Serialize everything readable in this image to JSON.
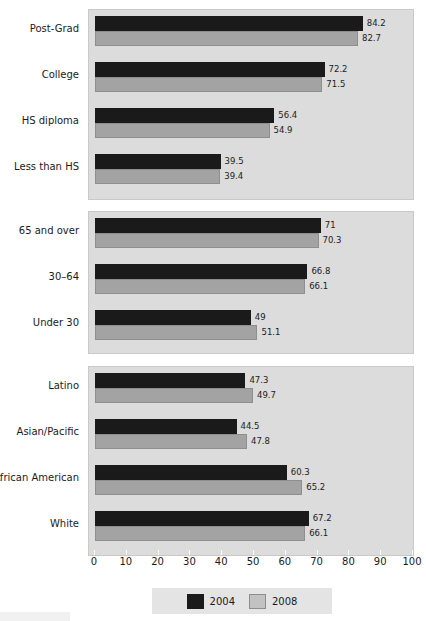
{
  "chart_data": {
    "type": "bar",
    "orientation": "horizontal",
    "title": "",
    "xlabel": "",
    "ylabel": "",
    "xlim": [
      0,
      100
    ],
    "xticks": [
      0,
      10,
      20,
      30,
      40,
      50,
      60,
      70,
      80,
      90,
      100
    ],
    "grid": false,
    "legend_position": "bottom-center",
    "legend": [
      "2004",
      "2008"
    ],
    "series": [
      {
        "name": "2004",
        "color": "#1a1a1a"
      },
      {
        "name": "2008",
        "color": "#a3a3a3"
      }
    ],
    "panels": [
      {
        "name": "education",
        "categories": [
          "Post-Grad",
          "College",
          "HS diploma",
          "Less than HS"
        ],
        "values_2004": [
          84.2,
          72.2,
          56.4,
          39.5
        ],
        "values_2008": [
          82.7,
          71.5,
          54.9,
          39.4
        ]
      },
      {
        "name": "age",
        "categories": [
          "65 and over",
          "30–64",
          "Under 30"
        ],
        "values_2004": [
          71,
          66.8,
          49
        ],
        "values_2008": [
          70.3,
          66.1,
          51.1
        ]
      },
      {
        "name": "race-ethnicity",
        "categories": [
          "Latino",
          "Asian/Pacific",
          "African American",
          "White"
        ],
        "values_2004": [
          47.3,
          44.5,
          60.3,
          67.2
        ],
        "values_2008": [
          49.7,
          47.8,
          65.2,
          66.1
        ]
      }
    ],
    "value_labels": {
      "education": {
        "2004": [
          "84.2",
          "72.2",
          "56.4",
          "39.5"
        ],
        "2008": [
          "82.7",
          "71.5",
          "54.9",
          "39.4"
        ]
      },
      "age": {
        "2004": [
          "71",
          "66.8",
          "49"
        ],
        "2008": [
          "70.3",
          "66.1",
          "51.1"
        ]
      },
      "race-ethnicity": {
        "2004": [
          "47.3",
          "44.5",
          "60.3",
          "67.2"
        ],
        "2008": [
          "49.7",
          "47.8",
          "65.2",
          "66.1"
        ]
      }
    },
    "tick_labels": [
      "0",
      "10",
      "20",
      "30",
      "40",
      "50",
      "60",
      "70",
      "80",
      "90",
      "100"
    ]
  },
  "colors": {
    "series_2004": "#1a1a1a",
    "series_2008": "#a3a3a3",
    "panel_background": "#dcdcdc",
    "legend_background": "#e4e4e4",
    "page_background": "#ffffff",
    "text": "#1b1b1b"
  }
}
